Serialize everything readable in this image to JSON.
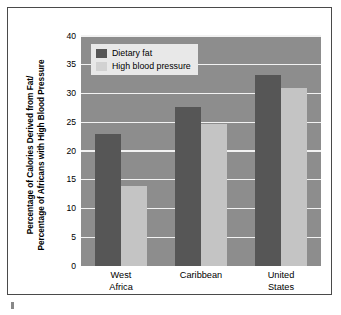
{
  "chart_data": {
    "type": "bar",
    "title": "",
    "xlabel": "",
    "ylabel": "Percentage of Calories Derived from Fat/ Percentage of Africans with High Blood Pressure",
    "ylabel_line1": "Percentage of Calories Derived from Fat/",
    "ylabel_line2": "Percentage of Africans with High Blood Pressure",
    "categories": [
      "West Africa",
      "Caribbean",
      "United States"
    ],
    "category_lines": [
      [
        "West",
        "Africa"
      ],
      [
        "Caribbean",
        ""
      ],
      [
        "United",
        "States"
      ]
    ],
    "series": [
      {
        "name": "Dietary fat",
        "values": [
          23,
          27.7,
          33.3
        ],
        "color": "#565656"
      },
      {
        "name": "High blood pressure",
        "values": [
          14,
          24.7,
          31
        ],
        "color": "#c4c4c4"
      }
    ],
    "ylim": [
      0,
      40
    ],
    "ytick_step": 5,
    "yticks": [
      0,
      5,
      10,
      15,
      20,
      25,
      30,
      35,
      40
    ],
    "ytick_labels": [
      "0",
      "5",
      "10",
      "15",
      "20",
      "25",
      "30",
      "35",
      "40"
    ],
    "grid": true,
    "grid_color": "#f2f2f2",
    "legend_position": "upper left",
    "plot_background": "#8d8d8d"
  },
  "legend": {
    "items": [
      {
        "label": "Dietary fat",
        "swatch": "dark"
      },
      {
        "label": "High blood pressure",
        "swatch": "light"
      }
    ]
  }
}
